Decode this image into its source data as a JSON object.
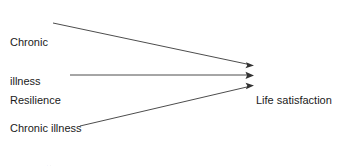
{
  "diagram": {
    "type": "path-model",
    "nodes": [
      {
        "id": "chronic-illness",
        "lines": [
          "Chronic",
          "illness"
        ],
        "line1": "Chronic",
        "line2": "illness"
      },
      {
        "id": "resilience",
        "lines": [
          "Resilience"
        ],
        "line1": "Resilience"
      },
      {
        "id": "interaction",
        "lines": [
          "Chronic illness",
          "×",
          "resilience",
          "(interaction)"
        ],
        "line1": "Chronic illness",
        "line2": "×",
        "line3": "resilience",
        "line4": "(interaction)"
      },
      {
        "id": "life-satisfaction",
        "lines": [
          "Life satisfaction"
        ],
        "line1": "Life satisfaction"
      }
    ],
    "edges": [
      {
        "id": "chronic-illness-to-life-satisfaction",
        "from": "chronic-illness",
        "to": "life-satisfaction",
        "style": "solid",
        "arrow": "single"
      },
      {
        "id": "resilience-to-life-satisfaction",
        "from": "resilience",
        "to": "life-satisfaction",
        "style": "solid",
        "arrow": "single"
      },
      {
        "id": "interaction-to-life-satisfaction",
        "from": "interaction",
        "to": "life-satisfaction",
        "style": "solid",
        "arrow": "single"
      }
    ],
    "colors": {
      "background": "#ffffff",
      "text": "#1a1a1a",
      "line": "#4d4d4d",
      "arrowhead": "#333333"
    }
  }
}
